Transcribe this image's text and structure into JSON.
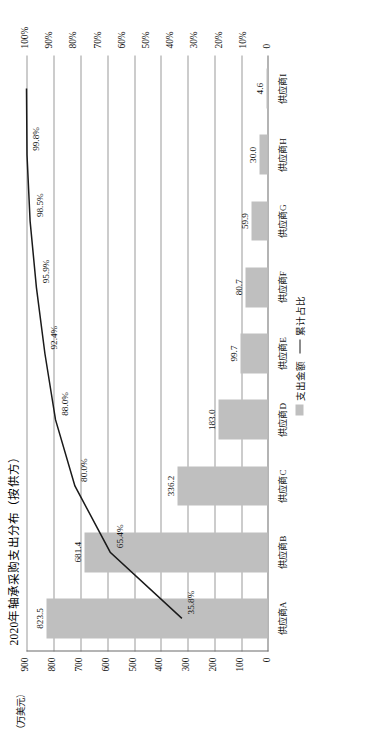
{
  "chart_data": {
    "type": "bar",
    "title": "2020年轴承采购支出分布（按供方）",
    "xlabel": "",
    "ylabel": "（万美元）",
    "y2label": "",
    "ylim": [
      0,
      900
    ],
    "y2lim": [
      0,
      1.0
    ],
    "grid": true,
    "legend_position": "bottom-center",
    "categories": [
      "供应商A",
      "供应商B",
      "供应商C",
      "供应商D",
      "供应商E",
      "供应商F",
      "供应商G",
      "供应商H",
      "供应商I"
    ],
    "series": [
      {
        "name": "支出金额",
        "chart_type": "bar",
        "color": "#bfbfbf",
        "values": [
          823.5,
          681.4,
          336.2,
          183.0,
          99.7,
          80.7,
          59.9,
          30.0,
          4.6
        ],
        "labels": [
          "823.5",
          "681.4",
          "336.2",
          "183.0",
          "99.7",
          "80.7",
          "59.9",
          "30.0",
          "4.6"
        ]
      },
      {
        "name": "累计占比",
        "chart_type": "line",
        "color": "#1a1a1a",
        "values": [
          35.8,
          65.4,
          80.0,
          88.0,
          92.4,
          95.9,
          98.5,
          99.8,
          100.0
        ],
        "labels": [
          "35.8%",
          "65.4%",
          "80.0%",
          "88.0%",
          "92.4%",
          "95.9%",
          "98.5%",
          "99.8%",
          ""
        ]
      }
    ],
    "yticks": [
      "0",
      "100",
      "200",
      "300",
      "400",
      "500",
      "600",
      "700",
      "800",
      "900"
    ],
    "y2ticks": [
      "0",
      "10%",
      "20%",
      "30%",
      "40%",
      "50%",
      "60%",
      "70%",
      "80%",
      "90%",
      "100%"
    ]
  },
  "legend": {
    "bar_label": "支出金额",
    "line_label": "累计占比"
  }
}
